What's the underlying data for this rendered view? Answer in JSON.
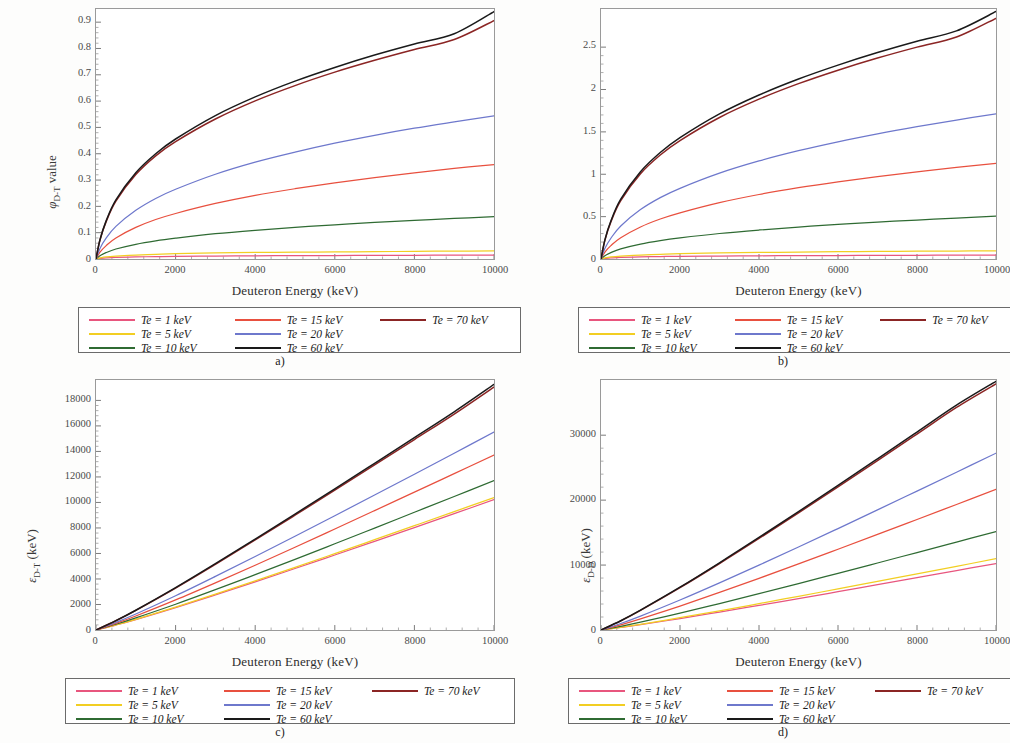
{
  "figure": {
    "background": "#fdfdfc",
    "shared_xlabel": "Deuteron Energy (keV)",
    "xticks": [
      "0",
      "2000",
      "4000",
      "6000",
      "8000",
      "10000"
    ],
    "xlim": [
      0,
      10000
    ]
  },
  "series_styles": [
    {
      "name": "Te = 1 keV",
      "color": "#E8567E"
    },
    {
      "name": "Te = 5 keV",
      "color": "#F2CE23"
    },
    {
      "name": "Te = 10 keV",
      "color": "#2F6B33"
    },
    {
      "name": "Te = 15 keV",
      "color": "#E8503F"
    },
    {
      "name": "Te = 20 keV",
      "color": "#6E78CC"
    },
    {
      "name": "Te = 60 keV",
      "color": "#1A1A1A"
    },
    {
      "name": "Te = 70 keV",
      "color": "#8B2524"
    }
  ],
  "legend": {
    "col1": [
      "Te = 1 keV",
      "Te = 5 keV",
      "Te = 10 keV"
    ],
    "col2": [
      "Te = 15 keV",
      "Te = 20 keV",
      "Te = 60 keV"
    ],
    "col3": [
      "Te = 70 keV",
      "",
      ""
    ]
  },
  "panels": [
    {
      "caption": "a)",
      "ylabel_main": "value",
      "ylabel_sym": "φ",
      "ylabel_sub": "D-T",
      "ylabel_full": "φ D-T value",
      "yticks": [
        "0",
        "0.1",
        "0.2",
        "0.3",
        "0.4",
        "0.5",
        "0.6",
        "0.7",
        "0.8",
        "0.9"
      ],
      "ylim": [
        0,
        0.95
      ]
    },
    {
      "caption": "b)",
      "ylabel_main": "value",
      "ylabel_sym": "φ",
      "ylabel_sub": "D-D",
      "ylabel_full": "φ D-D value",
      "yticks": [
        "0",
        "0.5",
        "1",
        "1.5",
        "2",
        "2.5"
      ],
      "ylim": [
        0,
        2.95
      ]
    },
    {
      "caption": "c)",
      "ylabel_main": "(keV)",
      "ylabel_sym": "ε",
      "ylabel_sub": "D-T",
      "ylabel_full": "ε D-T (keV)",
      "yticks": [
        "0",
        "2000",
        "4000",
        "6000",
        "8000",
        "10000",
        "12000",
        "14000",
        "16000",
        "18000"
      ],
      "ylim": [
        0,
        19600
      ]
    },
    {
      "caption": "d)",
      "ylabel_main": "(keV)",
      "ylabel_sym": "ε",
      "ylabel_sub": "D-D",
      "ylabel_full": "ε D-D (keV)",
      "yticks": [
        "0",
        "10000",
        "20000",
        "30000"
      ],
      "ylim": [
        0,
        38500
      ]
    }
  ],
  "chart_data": [
    {
      "type": "line",
      "panel": "a)",
      "title": "",
      "xlabel": "Deuteron Energy (keV)",
      "ylabel": "φ D-T value",
      "xlim": [
        0,
        10000
      ],
      "ylim": [
        0,
        0.95
      ],
      "grid": false,
      "legend_position": "below",
      "x": [
        0,
        100,
        250,
        500,
        1000,
        1500,
        2000,
        3000,
        4000,
        5000,
        6000,
        7000,
        8000,
        9000,
        10000
      ],
      "series": [
        {
          "name": "Te = 1 keV",
          "values": [
            0,
            0.002,
            0.004,
            0.006,
            0.008,
            0.009,
            0.01,
            0.011,
            0.012,
            0.013,
            0.013,
            0.014,
            0.014,
            0.015,
            0.015
          ]
        },
        {
          "name": "Te = 5 keV",
          "values": [
            0,
            0.004,
            0.008,
            0.011,
            0.015,
            0.018,
            0.02,
            0.023,
            0.025,
            0.026,
            0.027,
            0.028,
            0.029,
            0.03,
            0.031
          ]
        },
        {
          "name": "Te = 10 keV",
          "values": [
            0,
            0.012,
            0.024,
            0.038,
            0.056,
            0.069,
            0.079,
            0.096,
            0.109,
            0.12,
            0.13,
            0.139,
            0.147,
            0.154,
            0.161
          ]
        },
        {
          "name": "Te = 15 keV",
          "values": [
            0,
            0.026,
            0.05,
            0.08,
            0.12,
            0.15,
            0.173,
            0.211,
            0.242,
            0.267,
            0.289,
            0.309,
            0.327,
            0.344,
            0.359
          ]
        },
        {
          "name": "Te = 20 keV",
          "values": [
            0,
            0.04,
            0.078,
            0.124,
            0.185,
            0.23,
            0.265,
            0.322,
            0.368,
            0.406,
            0.44,
            0.47,
            0.497,
            0.521,
            0.544
          ]
        },
        {
          "name": "Te = 60 keV",
          "values": [
            0,
            0.073,
            0.143,
            0.225,
            0.328,
            0.4,
            0.456,
            0.545,
            0.616,
            0.676,
            0.728,
            0.775,
            0.817,
            0.856,
            0.94
          ]
        },
        {
          "name": "Te = 70 keV",
          "values": [
            0,
            0.072,
            0.14,
            0.22,
            0.321,
            0.392,
            0.446,
            0.532,
            0.601,
            0.659,
            0.71,
            0.755,
            0.796,
            0.834,
            0.906
          ]
        }
      ]
    },
    {
      "type": "line",
      "panel": "b)",
      "title": "",
      "xlabel": "Deuteron Energy (keV)",
      "ylabel": "φ D-D value",
      "xlim": [
        0,
        10000
      ],
      "ylim": [
        0,
        2.95
      ],
      "grid": false,
      "legend_position": "below",
      "x": [
        0,
        100,
        250,
        500,
        1000,
        1500,
        2000,
        3000,
        4000,
        5000,
        6000,
        7000,
        8000,
        9000,
        10000
      ],
      "series": [
        {
          "name": "Te = 1 keV",
          "values": [
            0,
            0.006,
            0.012,
            0.019,
            0.025,
            0.029,
            0.032,
            0.035,
            0.038,
            0.04,
            0.041,
            0.043,
            0.044,
            0.045,
            0.046
          ]
        },
        {
          "name": "Te = 5 keV",
          "values": [
            0,
            0.013,
            0.025,
            0.035,
            0.047,
            0.055,
            0.062,
            0.071,
            0.077,
            0.082,
            0.086,
            0.089,
            0.092,
            0.094,
            0.096
          ]
        },
        {
          "name": "Te = 10 keV",
          "values": [
            0,
            0.038,
            0.076,
            0.12,
            0.176,
            0.217,
            0.249,
            0.301,
            0.342,
            0.377,
            0.408,
            0.435,
            0.46,
            0.483,
            0.505
          ]
        },
        {
          "name": "Te = 15 keV",
          "values": [
            0,
            0.082,
            0.158,
            0.251,
            0.378,
            0.472,
            0.545,
            0.665,
            0.761,
            0.841,
            0.91,
            0.972,
            1.028,
            1.08,
            1.128
          ]
        },
        {
          "name": "Te = 20 keV",
          "values": [
            0,
            0.126,
            0.245,
            0.39,
            0.583,
            0.724,
            0.834,
            1.013,
            1.157,
            1.278,
            1.383,
            1.477,
            1.562,
            1.64,
            1.712
          ]
        },
        {
          "name": "Te = 60 keV",
          "values": [
            0,
            0.228,
            0.448,
            0.706,
            1.03,
            1.256,
            1.432,
            1.712,
            1.935,
            2.124,
            2.288,
            2.436,
            2.57,
            2.692,
            2.92
          ]
        },
        {
          "name": "Te = 70 keV",
          "values": [
            0,
            0.223,
            0.438,
            0.69,
            1.006,
            1.227,
            1.398,
            1.67,
            1.886,
            2.069,
            2.228,
            2.371,
            2.5,
            2.619,
            2.84
          ]
        }
      ]
    },
    {
      "type": "line",
      "panel": "c)",
      "title": "",
      "xlabel": "Deuteron Energy (keV)",
      "ylabel": "ε D-T (keV)",
      "xlim": [
        0,
        10000
      ],
      "ylim": [
        0,
        19600
      ],
      "grid": false,
      "legend_position": "below",
      "x": [
        0,
        500,
        1000,
        2000,
        3000,
        4000,
        5000,
        6000,
        7000,
        8000,
        9000,
        10000
      ],
      "series": [
        {
          "name": "Te = 1 keV",
          "values": [
            0,
            390,
            820,
            1760,
            2750,
            3770,
            4820,
            5880,
            6950,
            8030,
            9120,
            10220
          ]
        },
        {
          "name": "Te = 5 keV",
          "values": [
            0,
            400,
            840,
            1800,
            2810,
            3850,
            4910,
            5990,
            7080,
            8180,
            9280,
            10390
          ]
        },
        {
          "name": "Te = 10 keV",
          "values": [
            0,
            450,
            950,
            2020,
            3160,
            4340,
            5540,
            6760,
            7990,
            9230,
            10470,
            11720
          ]
        },
        {
          "name": "Te = 15 keV",
          "values": [
            0,
            520,
            1100,
            2360,
            3700,
            5080,
            6490,
            7920,
            9360,
            10810,
            12260,
            13710
          ]
        },
        {
          "name": "Te = 20 keV",
          "values": [
            0,
            590,
            1250,
            2680,
            4200,
            5760,
            7350,
            8960,
            10580,
            12210,
            13860,
            15520
          ]
        },
        {
          "name": "Te = 60 keV",
          "values": [
            0,
            730,
            1550,
            3320,
            5200,
            7130,
            9090,
            11070,
            13070,
            15080,
            17100,
            19250
          ]
        },
        {
          "name": "Te = 70 keV",
          "values": [
            0,
            725,
            1540,
            3290,
            5150,
            7060,
            9000,
            10960,
            12940,
            14930,
            16930,
            19050
          ]
        }
      ]
    },
    {
      "type": "line",
      "panel": "d)",
      "title": "",
      "xlabel": "Deuteron Energy (keV)",
      "ylabel": "ε D-D (keV)",
      "xlim": [
        0,
        10000
      ],
      "ylim": [
        0,
        38500
      ],
      "grid": false,
      "legend_position": "below",
      "x": [
        0,
        500,
        1000,
        2000,
        3000,
        4000,
        5000,
        6000,
        7000,
        8000,
        9000,
        10000
      ],
      "series": [
        {
          "name": "Te = 1 keV",
          "values": [
            0,
            390,
            820,
            1760,
            2760,
            3790,
            4840,
            5900,
            6980,
            8060,
            9150,
            10240
          ]
        },
        {
          "name": "Te = 5 keV",
          "values": [
            0,
            420,
            880,
            1890,
            2960,
            4060,
            5190,
            6330,
            7480,
            8640,
            9810,
            10980
          ]
        },
        {
          "name": "Te = 10 keV",
          "values": [
            0,
            570,
            1210,
            2590,
            4070,
            5590,
            7150,
            8730,
            10320,
            11930,
            13540,
            15160
          ]
        },
        {
          "name": "Te = 15 keV",
          "values": [
            0,
            800,
            1710,
            3690,
            5790,
            7960,
            10180,
            12440,
            14720,
            17020,
            19330,
            21650
          ]
        },
        {
          "name": "Te = 20 keV",
          "values": [
            0,
            1000,
            2140,
            4620,
            7260,
            9990,
            12780,
            15620,
            18490,
            21390,
            24300,
            27230
          ]
        },
        {
          "name": "Te = 60 keV",
          "values": [
            0,
            1430,
            3060,
            6590,
            10350,
            14250,
            18230,
            22280,
            26370,
            30490,
            34630,
            38300
          ]
        },
        {
          "name": "Te = 70 keV",
          "values": [
            0,
            1415,
            3030,
            6520,
            10240,
            14100,
            18040,
            22050,
            26100,
            30180,
            34280,
            37900
          ]
        }
      ]
    }
  ]
}
